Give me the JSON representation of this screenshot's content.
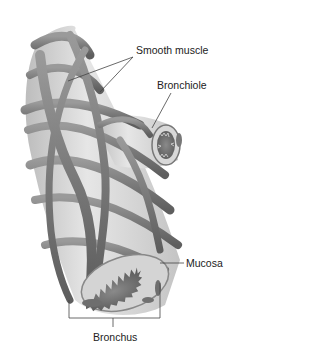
{
  "figure": {
    "labels": {
      "smooth_muscle": "Smooth muscle",
      "bronchiole": "Bronchiole",
      "mucosa": "Mucosa",
      "bronchus": "Bronchus"
    },
    "colors": {
      "background": "#ffffff",
      "muscle_dark": "#6e6e6e",
      "muscle_mid": "#8c8c8c",
      "tube_light": "#dcdcdc",
      "lumen": "#7a7a7a",
      "leader": "#444444"
    }
  }
}
